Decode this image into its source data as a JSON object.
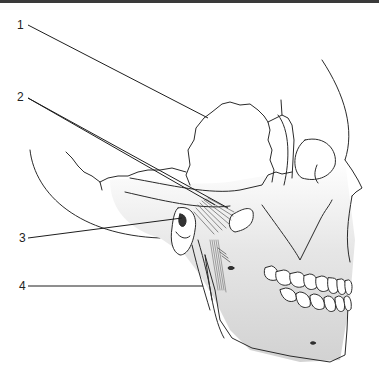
{
  "diagram": {
    "labels": [
      {
        "id": "1",
        "text": "1",
        "x": 17,
        "y": 19
      },
      {
        "id": "2",
        "text": "2",
        "x": 17,
        "y": 91
      },
      {
        "id": "3",
        "text": "3",
        "x": 19,
        "y": 232
      },
      {
        "id": "4",
        "text": "4",
        "x": 19,
        "y": 280
      }
    ],
    "colors": {
      "line": "#2a2a2a",
      "bone_shade": "#d9d9d9",
      "background": "#ffffff",
      "top_strip": "#3a3a3a"
    }
  }
}
